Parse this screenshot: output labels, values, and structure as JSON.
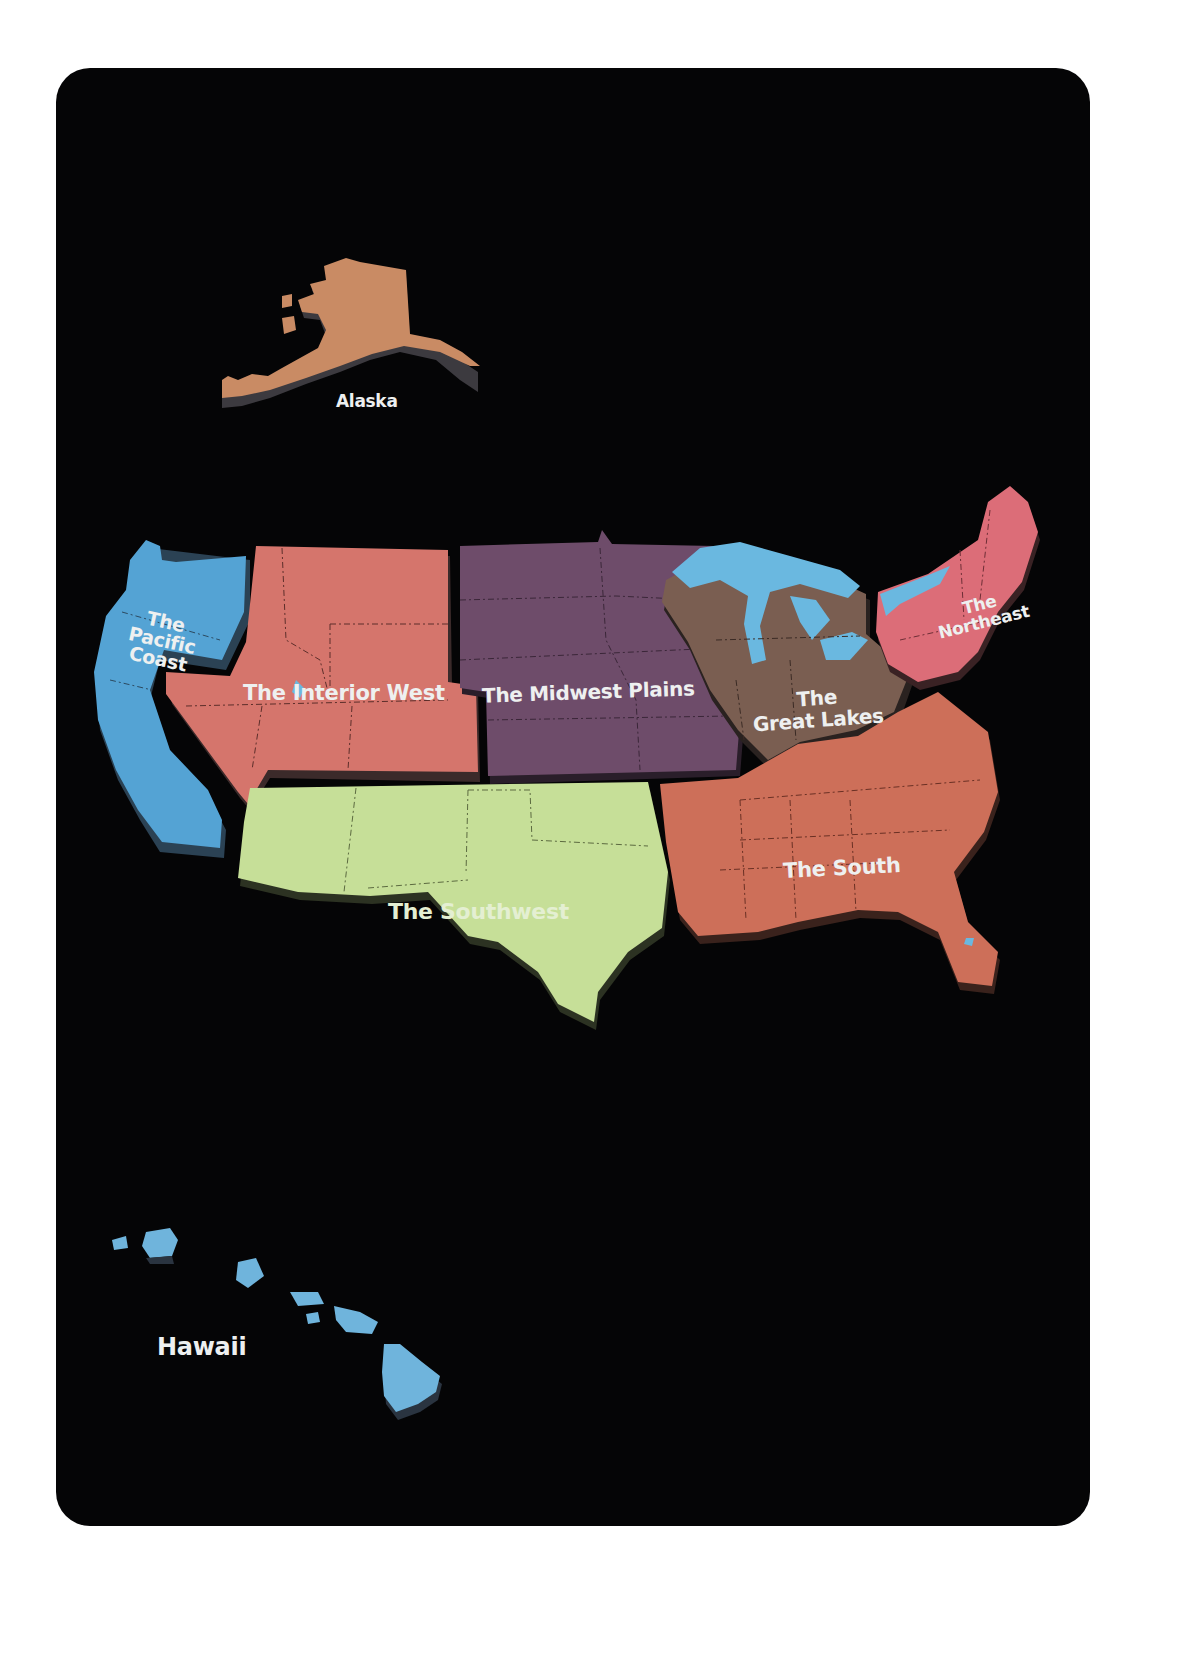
{
  "map": {
    "type": "3d-relief-region-map",
    "subject": "United States regions",
    "background_color": "#050506",
    "page_color": "#ffffff",
    "extrusion_color": "#3a3a3e",
    "regions": [
      {
        "id": "alaska",
        "label": "Alaska",
        "color": "#c98b64"
      },
      {
        "id": "pacific-coast",
        "label_lines": [
          "The",
          "Pacific",
          "Coast"
        ],
        "color": "#54a3d4"
      },
      {
        "id": "interior-west",
        "label": "The Interior West",
        "color": "#d5756c"
      },
      {
        "id": "midwest-plains",
        "label": "The Midwest Plains",
        "color": "#6e4c6a"
      },
      {
        "id": "great-lakes",
        "label_lines": [
          "The",
          "Great Lakes"
        ],
        "color": "#7a5e51",
        "water_color": "#6ab8e0"
      },
      {
        "id": "northeast",
        "label_lines": [
          "The",
          "Northeast"
        ],
        "color": "#dc6d78"
      },
      {
        "id": "south",
        "label": "The South",
        "color": "#cd6f59"
      },
      {
        "id": "southwest",
        "label": "The Southwest",
        "color": "#c6df98"
      },
      {
        "id": "hawaii",
        "label": "Hawaii",
        "color": "#6fb4dc"
      }
    ]
  }
}
